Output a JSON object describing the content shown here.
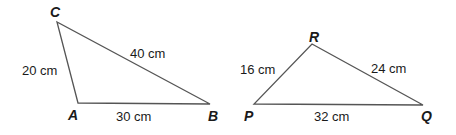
{
  "diagram": {
    "triangles": [
      {
        "name": "ABC",
        "vertices": [
          {
            "label": "A",
            "x": 78,
            "y": 103,
            "lx": 68,
            "ly": 120
          },
          {
            "label": "B",
            "x": 210,
            "y": 104,
            "lx": 208,
            "ly": 121
          },
          {
            "label": "C",
            "x": 57,
            "y": 22,
            "lx": 50,
            "ly": 17
          }
        ],
        "sides": [
          {
            "between": "A-B",
            "label": "30 cm",
            "lx": 116,
            "ly": 121
          },
          {
            "between": "A-C",
            "label": "20 cm",
            "lx": 22,
            "ly": 75
          },
          {
            "between": "B-C",
            "label": "40 cm",
            "lx": 130,
            "ly": 58
          }
        ]
      },
      {
        "name": "PQR",
        "vertices": [
          {
            "label": "P",
            "x": 254,
            "y": 104,
            "lx": 244,
            "ly": 121
          },
          {
            "label": "Q",
            "x": 423,
            "y": 105,
            "lx": 421,
            "ly": 121
          },
          {
            "label": "R",
            "x": 312,
            "y": 44,
            "lx": 309,
            "ly": 42
          }
        ],
        "sides": [
          {
            "between": "P-Q",
            "label": "32 cm",
            "lx": 314,
            "ly": 121
          },
          {
            "between": "P-R",
            "label": "16 cm",
            "lx": 240,
            "ly": 74
          },
          {
            "between": "Q-R",
            "label": "24 cm",
            "lx": 371,
            "ly": 73
          }
        ]
      }
    ],
    "colors": {
      "line": "#555555",
      "text": "#1a1a1a",
      "background": "#ffffff"
    }
  },
  "labels": {
    "A": "A",
    "B": "B",
    "C": "C",
    "P": "P",
    "Q": "Q",
    "R": "R",
    "AB": "30 cm",
    "AC": "20 cm",
    "BC": "40 cm",
    "PQ": "32 cm",
    "PR": "16 cm",
    "QR": "24 cm"
  }
}
